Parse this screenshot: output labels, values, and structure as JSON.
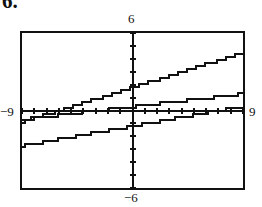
{
  "problem": {
    "number": "6."
  },
  "figure": {
    "type": "graphing-calculator-screen",
    "frame": {
      "x": 20,
      "y": 31,
      "width": 225,
      "height": 159
    }
  },
  "axis_labels": {
    "top": "6",
    "bottom": "−6",
    "left": "−9",
    "right": "9"
  },
  "chart_data": {
    "type": "line",
    "title": "",
    "xlabel": "",
    "ylabel": "",
    "xlim": [
      -9,
      9
    ],
    "ylim": [
      -6,
      6
    ],
    "grid": false,
    "legend": "none",
    "x_tick_step": 1,
    "y_tick_step": 1,
    "tick_marks": true,
    "axes_style": "standard-viewing-window",
    "window": {
      "Xmin": -9,
      "Xmax": 9,
      "Xscl": 1,
      "Ymin": -6,
      "Ymax": 6,
      "Yscl": 1
    },
    "series": [
      {
        "name": "line-1",
        "description": "steepest line, positive slope, crosses y-axis above origin",
        "slope": 0.3,
        "intercept": 1.8,
        "points": [
          [
            -9,
            -0.9
          ],
          [
            0,
            1.8
          ],
          [
            9,
            4.5
          ]
        ],
        "color": "#111111"
      },
      {
        "name": "line-2",
        "description": "shallow line, positive slope, nearly along the x-axis",
        "slope": 0.11,
        "intercept": 0.3,
        "points": [
          [
            -9,
            -0.69
          ],
          [
            0,
            0.3
          ],
          [
            9,
            1.29
          ]
        ],
        "color": "#111111"
      },
      {
        "name": "line-3",
        "description": "lower line, positive slope, crosses x-axis right of origin",
        "slope": 0.17,
        "intercept": -1.2,
        "points": [
          [
            -9,
            -2.73
          ],
          [
            0,
            -1.2
          ],
          [
            9,
            0.33
          ]
        ],
        "color": "#111111"
      }
    ]
  }
}
